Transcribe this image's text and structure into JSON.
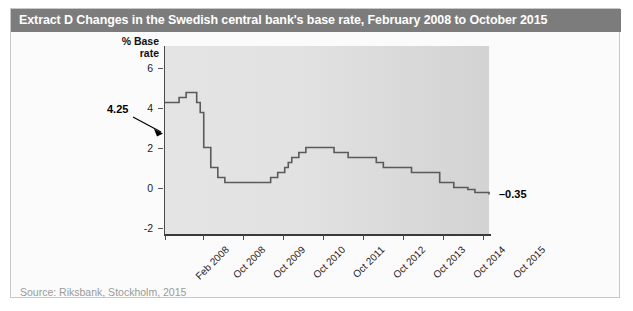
{
  "figure": {
    "title": "Extract D Changes in the Swedish central bank's base rate, February 2008 to October 2015",
    "source": "Source: Riksbank, Stockholm, 2015",
    "colors": {
      "title_bar": "#7c7c7c",
      "title_text": "#ffffff",
      "plot_background": "#e0e0e0",
      "line": "#5a5a5a",
      "source_text": "#9a9a9a"
    }
  },
  "chart_data": {
    "type": "line",
    "title": "Extract D Changes in the Swedish central bank's base rate, February 2008 to October 2015",
    "subtitle": "",
    "xlabel": "",
    "ylabel": "% Base rate",
    "ylabel_line1": "% Base",
    "ylabel_line2": "rate",
    "ylim": [
      -3,
      6.6
    ],
    "yticks": [
      6,
      4,
      2,
      0,
      -2
    ],
    "ytick_labels": [
      "6",
      "4",
      "2",
      "0",
      "-2"
    ],
    "grid": false,
    "legend": "none",
    "step_style": "post",
    "xtick_labels": [
      "Feb 2008",
      "Oct 2008",
      "Oct 2009",
      "Oct 2010",
      "Oct 2011",
      "Oct 2012",
      "Oct 2013",
      "Oct 2014",
      "Oct 2015"
    ],
    "xtick_positions_months": [
      0,
      8,
      20,
      32,
      44,
      56,
      68,
      80,
      92
    ],
    "annotations": [
      {
        "label": "4.25",
        "value": 4.25,
        "at": "Feb 2008",
        "kind": "start-value-with-arrow"
      },
      {
        "label": "-0.35",
        "value": -0.35,
        "at": "Oct 2015",
        "kind": "end-value"
      }
    ],
    "x": [
      0,
      2,
      4,
      6,
      8,
      9,
      10,
      11,
      12,
      13,
      15,
      17,
      20,
      28,
      30,
      32,
      34,
      35,
      36,
      38,
      40,
      44,
      48,
      52,
      56,
      60,
      62,
      66,
      70,
      74,
      78,
      82,
      86,
      88,
      92
    ],
    "values": [
      4.25,
      4.25,
      4.5,
      4.75,
      4.75,
      4.25,
      3.75,
      2.0,
      2.0,
      1.0,
      0.5,
      0.25,
      0.25,
      0.25,
      0.5,
      0.75,
      1.0,
      1.25,
      1.5,
      1.75,
      2.0,
      2.0,
      1.75,
      1.5,
      1.5,
      1.25,
      1.0,
      1.0,
      0.75,
      0.75,
      0.25,
      0.0,
      -0.1,
      -0.25,
      -0.35
    ],
    "series": [
      {
        "name": "Swedish central bank base rate",
        "unit": "%",
        "points": [
          {
            "period": "Feb 2008",
            "rate": 4.25
          },
          {
            "period": "Apr 2008",
            "rate": 4.25
          },
          {
            "period": "Jun 2008",
            "rate": 4.5
          },
          {
            "period": "Aug 2008",
            "rate": 4.75
          },
          {
            "period": "Oct 2008",
            "rate": 4.75
          },
          {
            "period": "Nov 2008",
            "rate": 4.25
          },
          {
            "period": "Dec 2008",
            "rate": 3.75
          },
          {
            "period": "Jan 2009",
            "rate": 2.0
          },
          {
            "period": "Feb 2009",
            "rate": 2.0
          },
          {
            "period": "Mar 2009",
            "rate": 1.0
          },
          {
            "period": "May 2009",
            "rate": 0.5
          },
          {
            "period": "Jul 2009",
            "rate": 0.25
          },
          {
            "period": "Oct 2009",
            "rate": 0.25
          },
          {
            "period": "Jun 2010",
            "rate": 0.25
          },
          {
            "period": "Aug 2010",
            "rate": 0.5
          },
          {
            "period": "Oct 2010",
            "rate": 0.75
          },
          {
            "period": "Dec 2010",
            "rate": 1.0
          },
          {
            "period": "Jan 2011",
            "rate": 1.25
          },
          {
            "period": "Feb 2011",
            "rate": 1.5
          },
          {
            "period": "Apr 2011",
            "rate": 1.75
          },
          {
            "period": "Jun 2011",
            "rate": 2.0
          },
          {
            "period": "Oct 2011",
            "rate": 2.0
          },
          {
            "period": "Feb 2012",
            "rate": 1.75
          },
          {
            "period": "Jun 2012",
            "rate": 1.5
          },
          {
            "period": "Oct 2012",
            "rate": 1.5
          },
          {
            "period": "Feb 2013",
            "rate": 1.25
          },
          {
            "period": "Apr 2013",
            "rate": 1.0
          },
          {
            "period": "Aug 2013",
            "rate": 1.0
          },
          {
            "period": "Dec 2013",
            "rate": 0.75
          },
          {
            "period": "Apr 2014",
            "rate": 0.75
          },
          {
            "period": "Aug 2014",
            "rate": 0.25
          },
          {
            "period": "Dec 2014",
            "rate": 0.0
          },
          {
            "period": "Apr 2015",
            "rate": -0.1
          },
          {
            "period": "Jun 2015",
            "rate": -0.25
          },
          {
            "period": "Oct 2015",
            "rate": -0.35
          }
        ]
      }
    ]
  }
}
